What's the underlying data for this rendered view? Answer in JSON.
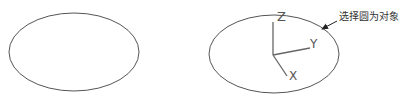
{
  "diagram": {
    "left_figure": {
      "shape": "ellipse",
      "cx": 74,
      "cy": 52,
      "rx": 65,
      "ry": 39
    },
    "right_figure": {
      "shape": "ellipse",
      "cx": 274,
      "cy": 54,
      "rx": 65,
      "ry": 39,
      "ucs_origin": [
        273,
        55
      ],
      "axes": [
        {
          "name": "Z",
          "label": "Z",
          "end": [
            273,
            22
          ],
          "label_pos": [
            279,
            22
          ]
        },
        {
          "name": "Y",
          "label": "Y",
          "end": [
            310,
            48
          ],
          "label_pos": [
            312,
            45
          ]
        },
        {
          "name": "X",
          "label": "X",
          "end": [
            287,
            76
          ],
          "label_pos": [
            292,
            78
          ]
        }
      ]
    },
    "annotation": {
      "text": "选择圆为对象",
      "text_pos": [
        338,
        20
      ],
      "arrow_from": [
        338,
        20
      ],
      "arrow_to": [
        320,
        30
      ]
    },
    "colors": {
      "stroke": "#555555",
      "axis": "#666666",
      "text": "#333333"
    }
  }
}
